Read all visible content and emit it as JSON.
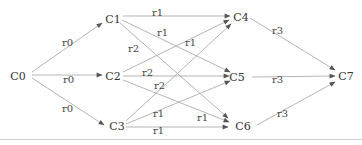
{
  "diagram": {
    "type": "directed-graph",
    "nodes": [
      {
        "id": "C0",
        "label": "C0",
        "x": 18,
        "y": 76
      },
      {
        "id": "C1",
        "label": "C1",
        "x": 113,
        "y": 19
      },
      {
        "id": "C2",
        "label": "C2",
        "x": 113,
        "y": 76
      },
      {
        "id": "C3",
        "label": "C3",
        "x": 117,
        "y": 126
      },
      {
        "id": "C4",
        "label": "C4",
        "x": 241,
        "y": 17
      },
      {
        "id": "C5",
        "label": "C5",
        "x": 237,
        "y": 77
      },
      {
        "id": "C6",
        "label": "C6",
        "x": 243,
        "y": 126
      },
      {
        "id": "C7",
        "label": "C7",
        "x": 346,
        "y": 76
      }
    ],
    "edges": [
      {
        "from": "C0",
        "to": "C1",
        "label": "r0",
        "x1": 32,
        "y1": 72,
        "x2": 102,
        "y2": 23,
        "lx": 62,
        "ly": 46
      },
      {
        "from": "C0",
        "to": "C2",
        "label": "r0",
        "x1": 32,
        "y1": 75,
        "x2": 102,
        "y2": 75,
        "lx": 63,
        "ly": 83
      },
      {
        "from": "C0",
        "to": "C3",
        "label": "r0",
        "x1": 32,
        "y1": 78,
        "x2": 104,
        "y2": 125,
        "lx": 62,
        "ly": 112
      },
      {
        "from": "C1",
        "to": "C4",
        "label": "r1",
        "x1": 123,
        "y1": 16,
        "x2": 230,
        "y2": 16,
        "lx": 152,
        "ly": 16
      },
      {
        "from": "C1",
        "to": "C5",
        "label": "r1",
        "x1": 122,
        "y1": 20,
        "x2": 230,
        "y2": 72,
        "lx": 157,
        "ly": 36
      },
      {
        "from": "C1",
        "to": "C6",
        "label": "r2",
        "x1": 120,
        "y1": 23,
        "x2": 228,
        "y2": 118,
        "lx": 128,
        "ly": 52
      },
      {
        "from": "C2",
        "to": "C4",
        "label": "r1",
        "x1": 123,
        "y1": 72,
        "x2": 229,
        "y2": 20,
        "lx": 185,
        "ly": 46
      },
      {
        "from": "C2",
        "to": "C5",
        "label": "r2",
        "x1": 123,
        "y1": 76,
        "x2": 229,
        "y2": 76,
        "lx": 142,
        "ly": 76
      },
      {
        "from": "C2",
        "to": "C6",
        "label": "r2",
        "x1": 123,
        "y1": 80,
        "x2": 229,
        "y2": 122,
        "lx": 154,
        "ly": 89
      },
      {
        "from": "C3",
        "to": "C4",
        "label": "",
        "x1": 126,
        "y1": 121,
        "x2": 231,
        "y2": 24,
        "lx": 0,
        "ly": 0
      },
      {
        "from": "C3",
        "to": "C5",
        "label": "r1",
        "x1": 126,
        "y1": 124,
        "x2": 230,
        "y2": 81,
        "lx": 153,
        "ly": 117
      },
      {
        "from": "C3",
        "to": "C6",
        "label": "r1",
        "x1": 126,
        "y1": 127,
        "x2": 228,
        "y2": 127,
        "lx": 153,
        "ly": 134
      },
      {
        "from": "C2",
        "to": "C6b",
        "label": "r1",
        "x1": 0,
        "y1": 0,
        "x2": 0,
        "y2": 0,
        "lx": 197,
        "ly": 121
      },
      {
        "from": "C4",
        "to": "C7",
        "label": "r3",
        "x1": 250,
        "y1": 18,
        "x2": 335,
        "y2": 70,
        "lx": 272,
        "ly": 34
      },
      {
        "from": "C5",
        "to": "C7",
        "label": "r3",
        "x1": 252,
        "y1": 77,
        "x2": 335,
        "y2": 76,
        "lx": 272,
        "ly": 83
      },
      {
        "from": "C6",
        "to": "C7",
        "label": "r3",
        "x1": 257,
        "y1": 125,
        "x2": 335,
        "y2": 82,
        "lx": 277,
        "ly": 117
      }
    ]
  }
}
